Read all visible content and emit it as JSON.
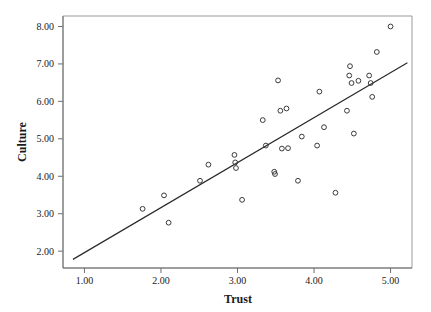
{
  "chart_data": {
    "type": "scatter",
    "title": "",
    "xlabel": "Trust",
    "ylabel": "Culture",
    "xlim": [
      0.72,
      5.28
    ],
    "ylim": [
      1.55,
      8.28
    ],
    "xticks": [
      1.0,
      2.0,
      3.0,
      4.0,
      5.0
    ],
    "xtick_labels": [
      "1.00",
      "2.00",
      "3.00",
      "4.00",
      "5.00"
    ],
    "yticks": [
      2.0,
      3.0,
      4.0,
      5.0,
      6.0,
      7.0,
      8.0
    ],
    "ytick_labels": [
      "2.00",
      "3.00",
      "4.00",
      "5.00",
      "6.00",
      "7.00",
      "8.00"
    ],
    "grid": false,
    "legend": null,
    "marker": "open-circle",
    "marker_color": "#3a3a3a",
    "points": [
      {
        "x": 1.76,
        "y": 3.13
      },
      {
        "x": 2.04,
        "y": 3.49
      },
      {
        "x": 2.1,
        "y": 2.76
      },
      {
        "x": 2.51,
        "y": 3.88
      },
      {
        "x": 2.62,
        "y": 4.31
      },
      {
        "x": 2.96,
        "y": 4.57
      },
      {
        "x": 2.97,
        "y": 4.37
      },
      {
        "x": 2.98,
        "y": 4.22
      },
      {
        "x": 3.06,
        "y": 3.37
      },
      {
        "x": 3.33,
        "y": 5.5
      },
      {
        "x": 3.37,
        "y": 4.82
      },
      {
        "x": 3.48,
        "y": 4.12
      },
      {
        "x": 3.49,
        "y": 4.06
      },
      {
        "x": 3.53,
        "y": 6.56
      },
      {
        "x": 3.56,
        "y": 5.75
      },
      {
        "x": 3.58,
        "y": 4.74
      },
      {
        "x": 3.64,
        "y": 5.81
      },
      {
        "x": 3.66,
        "y": 4.75
      },
      {
        "x": 3.79,
        "y": 3.88
      },
      {
        "x": 3.84,
        "y": 5.06
      },
      {
        "x": 4.04,
        "y": 4.82
      },
      {
        "x": 4.07,
        "y": 6.26
      },
      {
        "x": 4.13,
        "y": 5.31
      },
      {
        "x": 4.28,
        "y": 3.56
      },
      {
        "x": 4.43,
        "y": 5.75
      },
      {
        "x": 4.46,
        "y": 6.69
      },
      {
        "x": 4.47,
        "y": 6.94
      },
      {
        "x": 4.49,
        "y": 6.49
      },
      {
        "x": 4.52,
        "y": 5.14
      },
      {
        "x": 4.58,
        "y": 6.55
      },
      {
        "x": 4.72,
        "y": 6.69
      },
      {
        "x": 4.74,
        "y": 6.49
      },
      {
        "x": 4.76,
        "y": 6.12
      },
      {
        "x": 4.82,
        "y": 7.32
      },
      {
        "x": 5.0,
        "y": 8.0
      }
    ],
    "fit_line": {
      "name": "regression-line",
      "x1": 0.85,
      "y1": 1.78,
      "x2": 5.22,
      "y2": 7.03,
      "color": "#2b2b2b"
    },
    "frame": {
      "color": "#9a9a9a",
      "axis_color": "#6e6e6e"
    }
  }
}
